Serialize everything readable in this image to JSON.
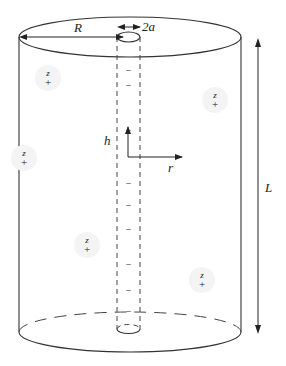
{
  "diagram": {
    "title": "",
    "labels": {
      "radius": "R",
      "rod_diameter": "2a",
      "length": "L",
      "axial_axis": "h",
      "radial_axis": "r"
    },
    "counterions": [
      {
        "valence_label": "z",
        "sign": "+",
        "x": 48,
        "y": 78
      },
      {
        "valence_label": "z",
        "sign": "+",
        "x": 215,
        "y": 100
      },
      {
        "valence_label": "z",
        "sign": "+",
        "x": 24,
        "y": 158
      },
      {
        "valence_label": "z",
        "sign": "+",
        "x": 87,
        "y": 245
      },
      {
        "valence_label": "z",
        "sign": "+",
        "x": 202,
        "y": 280
      }
    ],
    "rod_charges": {
      "sign": "−",
      "y_positions": [
        71,
        86,
        131,
        184,
        206,
        230,
        265,
        291,
        312
      ]
    },
    "colors": {
      "line": "#333333",
      "background": "#ffffff"
    }
  }
}
